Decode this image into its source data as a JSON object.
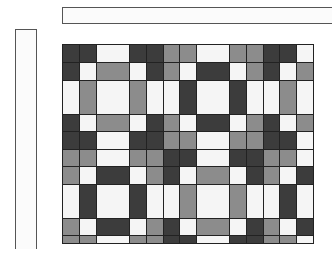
{
  "title_bar": {
    "label": ""
  },
  "side_bar": {
    "label": ""
  },
  "colors": {
    "D": "#3c3c3c",
    "G": "#8c8c8c",
    "W": "#f5f5f5",
    "border": "#222222"
  },
  "grid": {
    "col_edges": [
      62,
      79,
      96,
      129,
      146,
      163,
      179,
      196,
      229,
      246,
      263,
      279,
      296,
      313
    ],
    "row_edges": [
      44,
      62,
      80,
      114,
      131,
      149,
      166,
      184,
      218,
      235,
      243
    ],
    "rows": [
      [
        "D",
        "D",
        "W",
        "D",
        "D",
        "G",
        "G",
        "W",
        "G",
        "G",
        "D",
        "D",
        "W"
      ],
      [
        "D",
        "W",
        "G",
        "W",
        "D",
        "G",
        "W",
        "D",
        "W",
        "G",
        "D",
        "W",
        "G"
      ],
      [
        "W",
        "G",
        "W",
        "G",
        "W",
        "W",
        "D",
        "W",
        "D",
        "W",
        "W",
        "G",
        "W"
      ],
      [
        "D",
        "W",
        "G",
        "W",
        "D",
        "G",
        "W",
        "D",
        "W",
        "G",
        "D",
        "W",
        "G"
      ],
      [
        "D",
        "D",
        "W",
        "D",
        "D",
        "G",
        "G",
        "W",
        "G",
        "G",
        "D",
        "D",
        "W"
      ],
      [
        "G",
        "G",
        "W",
        "G",
        "G",
        "D",
        "D",
        "W",
        "D",
        "D",
        "G",
        "G",
        "W"
      ],
      [
        "G",
        "W",
        "D",
        "W",
        "G",
        "D",
        "W",
        "G",
        "W",
        "D",
        "G",
        "W",
        "D"
      ],
      [
        "W",
        "D",
        "W",
        "D",
        "W",
        "W",
        "G",
        "W",
        "G",
        "W",
        "W",
        "D",
        "W"
      ],
      [
        "G",
        "W",
        "D",
        "W",
        "G",
        "D",
        "W",
        "G",
        "W",
        "D",
        "G",
        "W",
        "D"
      ],
      [
        "G",
        "G",
        "W",
        "G",
        "G",
        "D",
        "D",
        "W",
        "D",
        "D",
        "G",
        "G",
        "W"
      ]
    ]
  }
}
